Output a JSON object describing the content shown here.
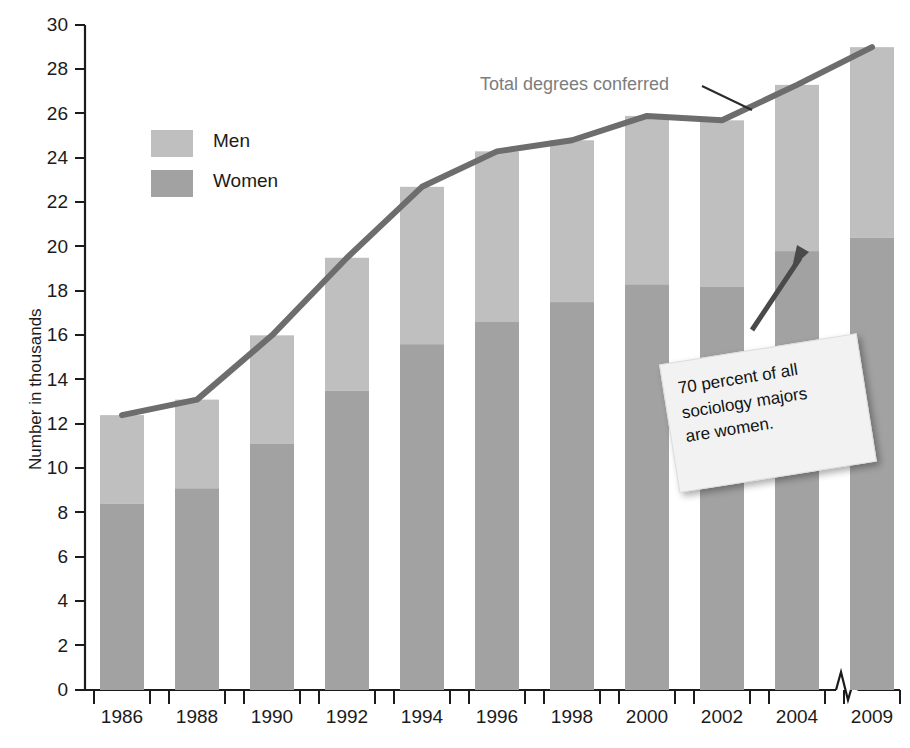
{
  "chart_data": {
    "type": "bar",
    "subtype": "stacked-bar-with-line-overlay",
    "title": "",
    "xlabel": "",
    "ylabel": "Number in thousands",
    "ylim": [
      0,
      30
    ],
    "ytick_step": 2,
    "yticks": [
      0,
      2,
      4,
      6,
      8,
      10,
      12,
      14,
      16,
      18,
      20,
      22,
      24,
      26,
      28,
      30
    ],
    "grid": false,
    "x_axis_break_before_last": true,
    "categories": [
      "1986",
      "1988",
      "1990",
      "1992",
      "1994",
      "1996",
      "1998",
      "2000",
      "2002",
      "2004",
      "2009"
    ],
    "series": [
      {
        "name": "Women",
        "values": [
          8.4,
          9.1,
          11.1,
          13.5,
          15.6,
          16.6,
          17.5,
          18.3,
          18.2,
          19.8,
          20.4
        ]
      },
      {
        "name": "Men",
        "values": [
          4.0,
          4.0,
          4.9,
          6.0,
          7.1,
          7.7,
          7.3,
          7.6,
          7.5,
          7.5,
          8.6
        ]
      }
    ],
    "line_series": {
      "name": "Total degrees conferred",
      "values": [
        12.4,
        13.1,
        16.0,
        19.5,
        22.7,
        24.3,
        24.8,
        25.9,
        25.7,
        27.3,
        29.0
      ]
    },
    "legend": {
      "position": "top-left",
      "entries": [
        "Men",
        "Women"
      ]
    },
    "annotations": [
      {
        "name": "line-label",
        "text": "Total degrees conferred"
      },
      {
        "name": "sticky-note",
        "text": "70 percent of all sociology majors are women."
      }
    ],
    "colors": {
      "men": "#bfbfbf",
      "women": "#a2a2a2",
      "line": "#6d6d6d",
      "axis": "#1b1b1b",
      "label": "#1b1b1b",
      "annotation_label": "#7d7d7d",
      "note_background": "#f2f2f2",
      "note_text": "#111111",
      "arrow": "#4a4a4a"
    }
  },
  "axis": {
    "y_title": "Number in thousands"
  },
  "legend": {
    "men": "Men",
    "women": "Women"
  },
  "annotations": {
    "line_label": "Total degrees conferred",
    "note_line1": "70 percent of all",
    "note_line2": "sociology majors",
    "note_line3": "are women."
  }
}
